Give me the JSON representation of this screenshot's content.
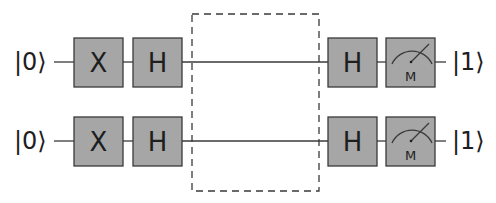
{
  "diagram": {
    "type": "quantum-circuit",
    "colors": {
      "gate_fill": "#a6a6a6",
      "line": "#3a3a3a",
      "text": "#1e1e1e",
      "background": "#ffffff"
    },
    "qubits": [
      {
        "input": "|0⟩",
        "gates": [
          "X",
          "H"
        ],
        "after_box_gates": [
          "H"
        ],
        "measurement": {
          "label": "M",
          "icon": "meter-icon"
        },
        "output": "|1⟩"
      },
      {
        "input": "|0⟩",
        "gates": [
          "X",
          "H"
        ],
        "after_box_gates": [
          "H"
        ],
        "measurement": {
          "label": "M",
          "icon": "meter-icon"
        },
        "output": "|1⟩"
      }
    ],
    "oracle_box": {
      "style": "dashed",
      "label": ""
    }
  }
}
